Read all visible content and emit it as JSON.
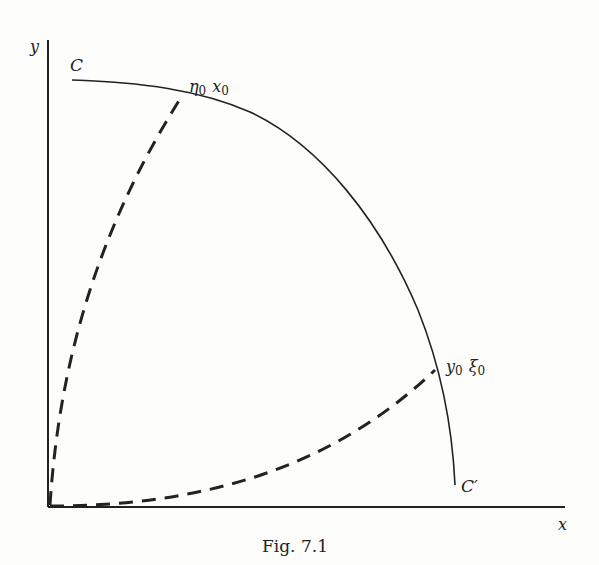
{
  "figure": {
    "caption": "Fig. 7.1",
    "axes": {
      "x_label": "x",
      "y_label": "y"
    },
    "curve": {
      "start_label": "C",
      "end_label": "C′"
    },
    "points": {
      "upper_label_eta": "η",
      "upper_label_eta_sub": "0",
      "upper_label_x": "x",
      "upper_label_x_sub": "0",
      "lower_label_y": "y",
      "lower_label_y_sub": "0",
      "lower_label_xi": "ξ",
      "lower_label_xi_sub": "0"
    },
    "colors": {
      "ink": "#222222",
      "paper": "#fdfdfc"
    }
  }
}
